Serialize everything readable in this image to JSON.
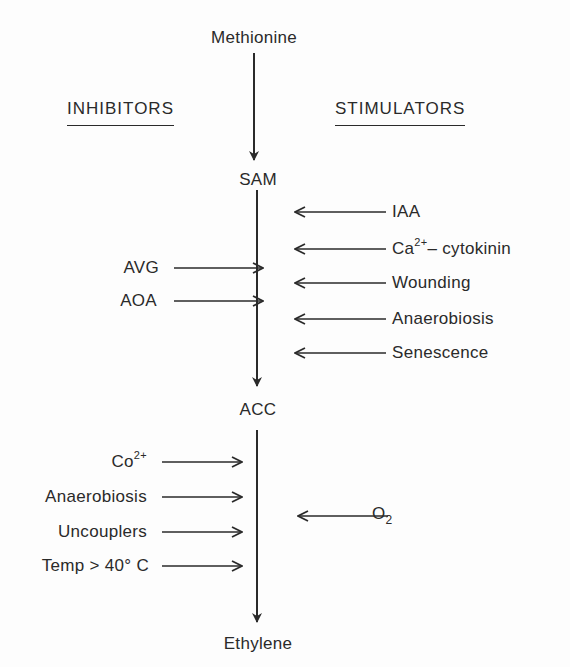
{
  "diagram": {
    "type": "pathway",
    "headers": {
      "inhibitors": "INHIBITORS",
      "stimulators": "STIMULATORS"
    },
    "nodes": [
      {
        "id": "methionine",
        "label": "Methionine"
      },
      {
        "id": "sam",
        "label": "SAM"
      },
      {
        "id": "acc",
        "label": "ACC"
      },
      {
        "id": "ethylene",
        "label": "Ethylene"
      }
    ],
    "edges": [
      {
        "from": "methionine",
        "to": "sam"
      },
      {
        "from": "sam",
        "to": "acc"
      },
      {
        "from": "acc",
        "to": "ethylene"
      }
    ],
    "sam_to_acc": {
      "stimulators": [
        {
          "label": "IAA"
        },
        {
          "label_main": "Ca",
          "label_sup": "2+",
          "label_rest": "– cytokinin",
          "label": "Ca2+-cytokinin"
        },
        {
          "label": "Wounding"
        },
        {
          "label": "Anaerobiosis"
        },
        {
          "label": "Senescence"
        }
      ],
      "inhibitors": [
        {
          "label": "AVG"
        },
        {
          "label": "AOA"
        }
      ]
    },
    "acc_to_ethylene": {
      "stimulators": [
        {
          "label_main": "O",
          "label_sub": "2",
          "label": "O2"
        }
      ],
      "inhibitors": [
        {
          "label_main": "Co",
          "label_sup": "2+",
          "label": "Co2+"
        },
        {
          "label": "Anaerobiosis"
        },
        {
          "label": "Uncouplers"
        },
        {
          "label": "Temp > 40° C"
        }
      ]
    }
  },
  "colors": {
    "ink": "#2a2a2a",
    "background": "#fdfdfd"
  }
}
